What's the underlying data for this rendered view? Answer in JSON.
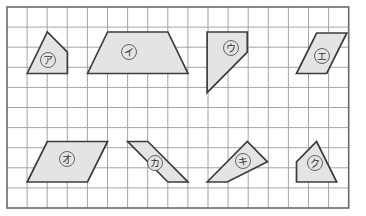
{
  "page": {
    "background_color": "#ffffff"
  },
  "grid": {
    "origin_x": 7,
    "origin_y": 7,
    "cell_size": 20.1,
    "columns": 17,
    "rows": 10,
    "line_color": "#9a9a9a",
    "line_width": 0.9,
    "border_color": "#6b6b6b",
    "border_width": 1.6
  },
  "shape_style": {
    "fill_color": "#e4e4e4",
    "stroke_color": "#3c3c3c",
    "stroke_width": 1.7,
    "label_circle_fill": "#e4e4e4",
    "label_circle_stroke": "#555555",
    "label_text_color": "#333333",
    "label_font_size": 10,
    "label_circle_radius": 7.5
  },
  "shapes": [
    {
      "id": "shape-a",
      "label": "ア",
      "label_romaji": "a",
      "kind": "quadrilateral",
      "points": "27.2,73.5 47.3,32.0 67.4,52.2 67.4,73.5",
      "label_x": 48,
      "label_y": 60
    },
    {
      "id": "shape-i",
      "label": "イ",
      "label_romaji": "i",
      "kind": "trapezoid",
      "points": "87.5,73.5 107.6,32.0 167.9,32.0 188.0,73.5",
      "label_x": 129,
      "label_y": 52
    },
    {
      "id": "shape-u",
      "label": "ウ",
      "label_romaji": "u",
      "kind": "trapezoid",
      "points": "207.1,32.0 247.3,32.0 247.3,52.2 207.1,92.6",
      "label_x": 231,
      "label_y": 48
    },
    {
      "id": "shape-e",
      "label": "エ",
      "label_romaji": "e",
      "kind": "parallelogram",
      "points": "296.5,73.5 316.6,33.0 346.8,33.0 326.7,73.5",
      "label_x": 322,
      "label_y": 56
    },
    {
      "id": "shape-o",
      "label": "オ",
      "label_romaji": "o",
      "kind": "trapezoid",
      "points": "27.2,182.0 47.3,141.5 107.6,141.5 87.5,182.0",
      "label_x": 67,
      "label_y": 159
    },
    {
      "id": "shape-ka",
      "label": "カ",
      "label_romaji": "ka",
      "kind": "parallelogram",
      "points": "127.7,141.5 147.8,141.5 188.0,182.0 167.9,182.0",
      "label_x": 155,
      "label_y": 163
    },
    {
      "id": "shape-ki",
      "label": "キ",
      "label_romaji": "ki",
      "kind": "quadrilateral",
      "points": "207.1,182.0 247.3,141.5 267.4,161.8 227.2,182.0",
      "label_x": 243,
      "label_y": 161
    },
    {
      "id": "shape-ku",
      "label": "ク",
      "label_romaji": "ku",
      "kind": "quadrilateral",
      "points": "296.5,182.0 296.5,161.8 316.6,141.5 336.7,182.0",
      "label_x": 315,
      "label_y": 163
    }
  ]
}
